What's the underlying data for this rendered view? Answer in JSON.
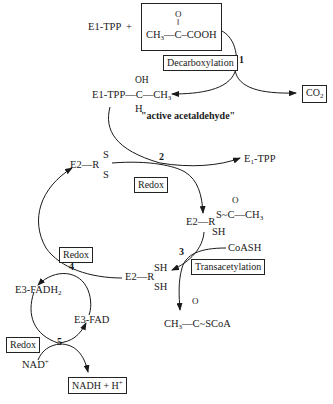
{
  "diagram": {
    "type": "reaction-pathway",
    "reactants": {
      "e1_tpp": "E1-TPP",
      "plus": "+",
      "pyruvate": {
        "oxygen": "O",
        "ch3": "CH",
        "ch3_sub": "3",
        "dash": "—C–",
        "cooh": "COOH"
      }
    },
    "steps": [
      {
        "number": "1",
        "label": "Decarboxylation"
      },
      {
        "number": "2",
        "label": "Redox"
      },
      {
        "number": "3",
        "label": "Transacetylation"
      },
      {
        "number": "4",
        "label": "Redox"
      },
      {
        "number": "5",
        "label": "Redox"
      }
    ],
    "products": {
      "co2": "CO",
      "co2_sub": "2",
      "e1_tpp_regen": "E",
      "e1_tpp_regen_sub": "1",
      "e1_tpp_regen_rest": "-TPP",
      "acetyl_coa": {
        "oxygen": "O",
        "ch3": "CH",
        "ch3_sub": "3",
        "rest": "—C~SCoA"
      },
      "nadh": "NADH + H",
      "nadh_sup": "+"
    },
    "intermediates": {
      "hydroxyethyl_tpp": {
        "oh": "OH",
        "main": "E1-TPP—C—CH",
        "main_sub": "3",
        "h": "H",
        "note": "\"active acetaldehyde\""
      },
      "lipoamide_oxidized": {
        "prefix": "E2—R",
        "s_top": "S",
        "s_bottom": "S"
      },
      "acetyl_lipoamide": {
        "prefix": "E2—R",
        "oxygen": "O",
        "thioester": "S~C—CH",
        "thioester_sub": "3",
        "sh": "SH"
      },
      "lipoamide_reduced": {
        "prefix": "E2—R",
        "sh_top": "SH",
        "sh_bottom": "SH"
      },
      "fadh2": {
        "text": "E3-FADH",
        "sub": "2"
      },
      "fad": "E3-FAD"
    },
    "cofactors": {
      "coash": "CoASH",
      "nad": "NAD",
      "nad_sup": "+"
    },
    "colors": {
      "ink": "#1a1a1a",
      "background": "#ffffff"
    }
  }
}
